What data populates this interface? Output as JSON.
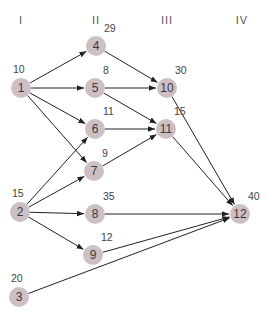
{
  "columns": [
    {
      "label": "I",
      "x": 21
    },
    {
      "label": "II",
      "x": 96
    },
    {
      "label": "III",
      "x": 167
    },
    {
      "label": "IV",
      "x": 242
    }
  ],
  "nodes": [
    {
      "id": "1",
      "x": 21,
      "y": 88,
      "weight": "10"
    },
    {
      "id": "2",
      "x": 20,
      "y": 212,
      "weight": "15"
    },
    {
      "id": "3",
      "x": 19,
      "y": 297,
      "weight": "20"
    },
    {
      "id": "4",
      "x": 96,
      "y": 46,
      "weight": "29"
    },
    {
      "id": "5",
      "x": 95,
      "y": 88,
      "weight": "8"
    },
    {
      "id": "6",
      "x": 95,
      "y": 129,
      "weight": "11"
    },
    {
      "id": "7",
      "x": 94,
      "y": 171,
      "weight": "9"
    },
    {
      "id": "8",
      "x": 95,
      "y": 214,
      "weight": "35"
    },
    {
      "id": "9",
      "x": 93,
      "y": 255,
      "weight": "12"
    },
    {
      "id": "10",
      "x": 167,
      "y": 88,
      "weight": "30"
    },
    {
      "id": "11",
      "x": 166,
      "y": 129,
      "weight": "15"
    },
    {
      "id": "12",
      "x": 240,
      "y": 214,
      "weight": "40"
    }
  ],
  "edges": [
    [
      "1",
      "4"
    ],
    [
      "1",
      "5"
    ],
    [
      "1",
      "6"
    ],
    [
      "1",
      "7"
    ],
    [
      "2",
      "6"
    ],
    [
      "2",
      "7"
    ],
    [
      "2",
      "8"
    ],
    [
      "2",
      "9"
    ],
    [
      "3",
      "12"
    ],
    [
      "4",
      "10"
    ],
    [
      "5",
      "10"
    ],
    [
      "5",
      "11"
    ],
    [
      "6",
      "11"
    ],
    [
      "7",
      "11"
    ],
    [
      "8",
      "12"
    ],
    [
      "9",
      "12"
    ],
    [
      "10",
      "12"
    ],
    [
      "11",
      "12"
    ]
  ],
  "colors": {
    "node_fill": "#cdbfc4",
    "edge": "#222222"
  }
}
